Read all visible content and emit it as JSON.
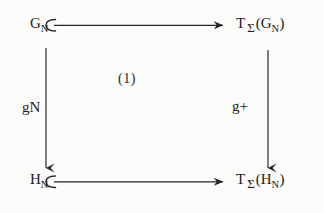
{
  "diagram": {
    "kind": "commutative-square",
    "center_label": "(1)",
    "nodes": {
      "top_left": {
        "base": "G",
        "sub": "N",
        "text": "G_N"
      },
      "top_right": {
        "t": "T",
        "sigma": "Σ",
        "open": "(",
        "base": "G",
        "sub": "N",
        "close": ")",
        "text": "T_Σ(G_N)"
      },
      "bottom_left": {
        "base": "H",
        "sub": "N",
        "text": "H_N"
      },
      "bottom_right": {
        "t": "T",
        "sigma": "Σ",
        "open": "(",
        "base": "H",
        "sub": "N",
        "close": ")",
        "text": "T_Σ(H_N)"
      }
    },
    "edges": {
      "top": {
        "label": "",
        "style": "hooked-arrow",
        "direction": "right"
      },
      "bottom": {
        "label": "",
        "style": "hooked-arrow",
        "direction": "right"
      },
      "left": {
        "base": "g",
        "sub": "N",
        "text": "g_N",
        "style": "arrow",
        "direction": "down"
      },
      "right": {
        "base": "g",
        "sup": "+",
        "text": "g+",
        "style": "arrow",
        "direction": "down"
      }
    },
    "colors": {
      "ink": "#222020",
      "background": "#fbfbf9",
      "stroke": "#262424"
    }
  }
}
